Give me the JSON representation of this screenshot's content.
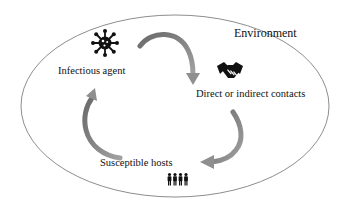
{
  "diagram": {
    "type": "cycle",
    "container": {
      "label": "Environment",
      "shape": "ellipse",
      "stroke": "#666666"
    },
    "nodes": [
      {
        "id": "agent",
        "label": "Infectious agent",
        "icon": "virus-icon"
      },
      {
        "id": "contacts",
        "label": "Direct or indirect contacts",
        "icon": "handshake-icon"
      },
      {
        "id": "hosts",
        "label": "Susceptible hosts",
        "icon": "people-icon"
      }
    ],
    "edges": [
      {
        "from": "agent",
        "to": "contacts"
      },
      {
        "from": "contacts",
        "to": "hosts"
      },
      {
        "from": "hosts",
        "to": "agent"
      }
    ],
    "colors": {
      "arrow": "#8a8a8a",
      "arrow_dark": "#6e6e6e",
      "icon": "#111111",
      "text": "#111111"
    }
  }
}
